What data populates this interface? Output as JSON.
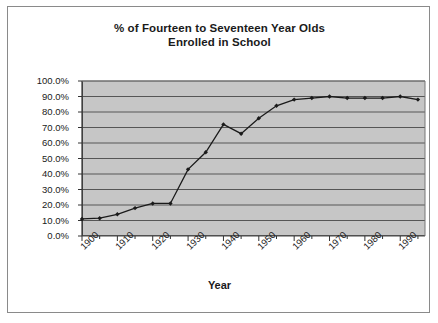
{
  "chart_data": {
    "type": "line",
    "title": "% of Fourteen to Seventeen Year Olds Enrolled in School",
    "title_lines": [
      "% of Fourteen to Seventeen Year Olds",
      "Enrolled in School"
    ],
    "xlabel": "Year",
    "ylabel": "",
    "xlim": [
      1900,
      1997
    ],
    "ylim": [
      0,
      100
    ],
    "ytick_labels": [
      "0.0%",
      "10.0%",
      "20.0%",
      "30.0%",
      "40.0%",
      "50.0%",
      "60.0%",
      "70.0%",
      "80.0%",
      "90.0%",
      "100.0%"
    ],
    "ytick_values": [
      0,
      10,
      20,
      30,
      40,
      50,
      60,
      70,
      80,
      90,
      100
    ],
    "xtick_labels": [
      "1900",
      "1910",
      "1920",
      "1930",
      "1940",
      "1950",
      "1960",
      "1970",
      "1980",
      "1990"
    ],
    "xtick_values": [
      1900,
      1910,
      1920,
      1930,
      1940,
      1950,
      1960,
      1970,
      1980,
      1990
    ],
    "minor_tick_step": 5,
    "grid": "horizontal",
    "legend": "none",
    "plot_background": "#c6c6c6",
    "line_color": "#1a1a1a",
    "marker": "diamond",
    "x": [
      1900,
      1905,
      1910,
      1915,
      1920,
      1925,
      1930,
      1935,
      1940,
      1945,
      1950,
      1955,
      1960,
      1965,
      1970,
      1975,
      1980,
      1985,
      1990,
      1995
    ],
    "values": [
      11,
      11.5,
      14,
      18,
      21,
      21,
      43,
      54,
      72,
      66,
      76,
      84,
      88,
      89,
      90,
      89,
      89,
      89,
      90,
      88
    ],
    "series": [
      {
        "name": "% enrolled",
        "points": [
          {
            "year": 1900,
            "value": 11
          },
          {
            "year": 1905,
            "value": 11.5
          },
          {
            "year": 1910,
            "value": 14
          },
          {
            "year": 1915,
            "value": 18
          },
          {
            "year": 1920,
            "value": 21
          },
          {
            "year": 1925,
            "value": 21
          },
          {
            "year": 1930,
            "value": 43
          },
          {
            "year": 1935,
            "value": 54
          },
          {
            "year": 1940,
            "value": 72
          },
          {
            "year": 1945,
            "value": 66
          },
          {
            "year": 1950,
            "value": 76
          },
          {
            "year": 1955,
            "value": 84
          },
          {
            "year": 1960,
            "value": 88
          },
          {
            "year": 1965,
            "value": 89
          },
          {
            "year": 1970,
            "value": 90
          },
          {
            "year": 1975,
            "value": 89
          },
          {
            "year": 1980,
            "value": 89
          },
          {
            "year": 1985,
            "value": 89
          },
          {
            "year": 1990,
            "value": 90
          },
          {
            "year": 1995,
            "value": 88
          }
        ]
      }
    ]
  }
}
